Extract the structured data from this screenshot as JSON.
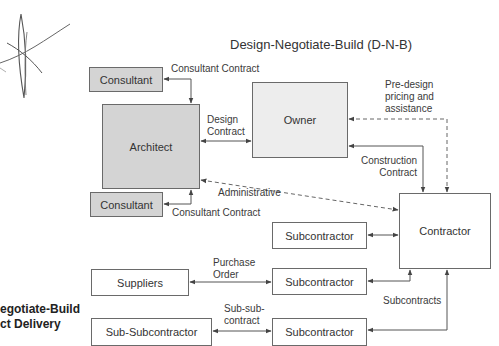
{
  "title": "Design-Negotiate-Build (D-N-B)",
  "side_caption": {
    "line1": "egotiate-Build",
    "line2": "ct Delivery"
  },
  "nodes": {
    "consultant_top": "Consultant",
    "architect": "Architect",
    "owner": "Owner",
    "consultant_bottom": "Consultant",
    "contractor": "Contractor",
    "subcontractor_1": "Subcontractor",
    "suppliers": "Suppliers",
    "subcontractor_2": "Subcontractor",
    "sub_subcontractor": "Sub-Subcontractor",
    "subcontractor_3": "Subcontractor"
  },
  "edge_labels": {
    "consultant_contract_top": "Consultant Contract",
    "design_contract_1": "Design",
    "design_contract_2": "Contract",
    "predesign_1": "Pre-design",
    "predesign_2": "pricing and",
    "predesign_3": "assistance",
    "construction_contract_1": "Construction",
    "construction_contract_2": "Contract",
    "administrative": "Administrative",
    "consultant_contract_bottom": "Consultant Contract",
    "purchase_order_1": "Purchase",
    "purchase_order_2": "Order",
    "sub_sub_contract_1": "Sub-sub-",
    "sub_sub_contract_2": "contract",
    "subcontracts": "Subcontracts"
  },
  "colors": {
    "shaded_box": "#d4d4d4",
    "light_box": "#ededed",
    "line": "#555555"
  }
}
